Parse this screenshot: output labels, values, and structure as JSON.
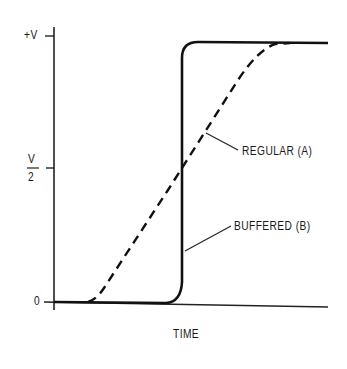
{
  "diagram": {
    "y_axis_ticks": [
      {
        "label": "+V",
        "y": 36
      },
      {
        "label_num": "V",
        "label_den": "2",
        "y": 168
      },
      {
        "label": "0",
        "y": 302
      }
    ],
    "x_axis_label": "TIME",
    "curves": [
      {
        "name": "REGULAR (A)",
        "style": "dashed",
        "description": "gradual rise from 0 to +V"
      },
      {
        "name": "BUFFERED (B)",
        "style": "solid",
        "description": "sharp rise from 0 to +V"
      }
    ],
    "labels": {
      "regular": "REGULAR (A)",
      "buffered": "BUFFERED (B)"
    }
  }
}
